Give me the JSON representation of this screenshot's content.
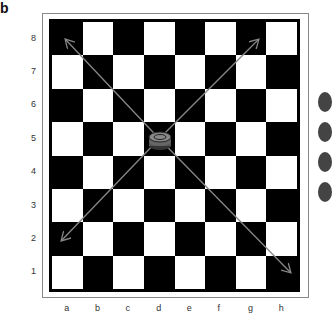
{
  "figure_label": "b",
  "board": {
    "files": [
      "a",
      "b",
      "c",
      "d",
      "e",
      "f",
      "g",
      "h"
    ],
    "ranks": [
      "8",
      "7",
      "6",
      "5",
      "4",
      "3",
      "2",
      "1"
    ],
    "top_left_square_color": "black",
    "piece": {
      "type": "checker-king-stack",
      "square": "d5"
    },
    "arrows": [
      {
        "from": "d5",
        "to": "a8"
      },
      {
        "from": "d5",
        "to": "h8"
      },
      {
        "from": "d5",
        "to": "a2"
      },
      {
        "from": "d5",
        "to": "h1"
      }
    ]
  },
  "colors": {
    "dark": "#000000",
    "light": "#ffffff",
    "arrow": "#777777"
  }
}
